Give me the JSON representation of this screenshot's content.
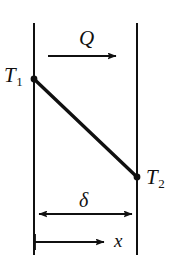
{
  "figure": {
    "domain_kind": "diagram",
    "background_color": "#ffffff",
    "ink_color": "#101010",
    "labels": {
      "heat_flow": "Q",
      "left_surface_temperature": "T",
      "left_surface_temperature_subscript": "1",
      "right_surface_temperature": "T",
      "right_surface_temperature_subscript": "2",
      "thickness": "δ",
      "coordinate": "x"
    },
    "geometry": {
      "left_wall_x": 34,
      "right_wall_x": 137,
      "wall_top_y": 23,
      "wall_bottom_y": 255,
      "profile_start": {
        "x": 34,
        "y": 79
      },
      "profile_end": {
        "x": 137,
        "y": 177
      },
      "heat_arrow": {
        "x1": 48,
        "x2": 122,
        "y": 56
      },
      "thickness_arrow": {
        "x1": 34,
        "x2": 137,
        "y": 214
      },
      "x_arrow": {
        "x1": 34,
        "x2": 110,
        "y": 242
      }
    }
  }
}
